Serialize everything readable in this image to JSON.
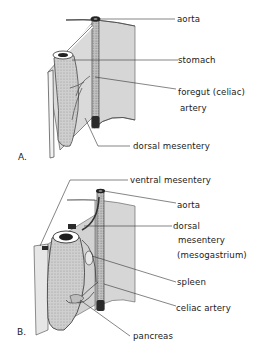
{
  "figure": {
    "panels": [
      {
        "id": "A",
        "label": "A.",
        "structures": [
          {
            "key": "aorta",
            "text": "aorta"
          },
          {
            "key": "stomach",
            "text": "stomach"
          },
          {
            "key": "foregut_artery_1",
            "text": "foregut (celiac)"
          },
          {
            "key": "foregut_artery_2",
            "text": "artery"
          },
          {
            "key": "dorsal_mesentery",
            "text": "dorsal mesentery"
          }
        ]
      },
      {
        "id": "B",
        "label": "B.",
        "structures": [
          {
            "key": "ventral_mesentery",
            "text": "ventral mesentery"
          },
          {
            "key": "aorta",
            "text": "aorta"
          },
          {
            "key": "dorsal_mesentery_1",
            "text": "dorsal"
          },
          {
            "key": "dorsal_mesentery_2",
            "text": "mesentery"
          },
          {
            "key": "dorsal_mesentery_3",
            "text": "(mesogastrium)"
          },
          {
            "key": "spleen",
            "text": "spleen"
          },
          {
            "key": "celiac_artery",
            "text": "celiac artery"
          },
          {
            "key": "pancreas",
            "text": "pancreas"
          }
        ]
      }
    ],
    "colors": {
      "mesentery_fill": "#d4d4d4",
      "line": "#2a2a2a",
      "aorta": "#3a3a3a",
      "background": "#ffffff"
    }
  }
}
